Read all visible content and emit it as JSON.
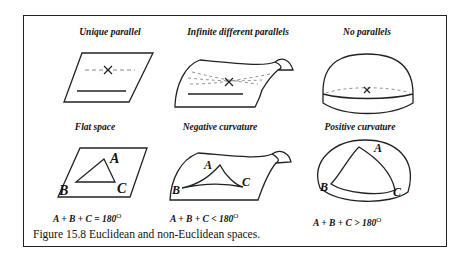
{
  "figure": {
    "caption": "Figure 15.8  Euclidean and non-Euclidean spaces.",
    "top_row": [
      {
        "title": "Unique parallel",
        "shape": "flat-plane"
      },
      {
        "title": "Infinite different parallels",
        "shape": "saddle"
      },
      {
        "title": "No parallels",
        "shape": "hemisphere"
      }
    ],
    "bottom_row": [
      {
        "title": "Flat space",
        "equation": "A + B + C = 180",
        "degree": "O",
        "vertices": [
          "A",
          "B",
          "C"
        ]
      },
      {
        "title": "Negative curvature",
        "equation": "A + B + C < 180",
        "degree": "O",
        "vertices": [
          "A",
          "B",
          "C"
        ]
      },
      {
        "title": "Positive curvature",
        "equation": "A + B + C > 180",
        "degree": "O",
        "vertices": [
          "A",
          "B",
          "C"
        ]
      }
    ],
    "colors": {
      "line": "#222222",
      "dashed": "#888888",
      "background": "#ffffff"
    }
  }
}
